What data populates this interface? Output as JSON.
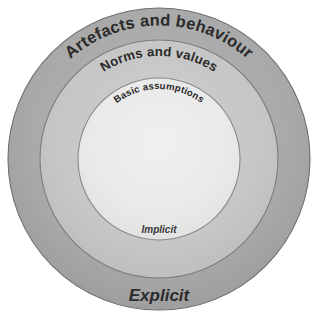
{
  "diagram": {
    "type": "concentric-circles",
    "background_color": "#ffffff",
    "center": {
      "x": 159,
      "y": 159
    },
    "rings": [
      {
        "id": "outer",
        "name": "artefacts-and-behaviour",
        "label": "Artefacts and behaviour",
        "radius": 151,
        "fill": "#a9a9a9",
        "stroke": "#6f6f6f",
        "label_style": "curved-top"
      },
      {
        "id": "middle",
        "name": "norms-and-values",
        "label": "Norms and values",
        "radius": 119,
        "fill": "#c6c6c6",
        "stroke": "#7c7c7c",
        "label_style": "curved-top"
      },
      {
        "id": "inner",
        "name": "basic-assumptions",
        "label": "Basic assumptions",
        "radius": 81,
        "fill": "#e9e9e9",
        "stroke": "#8a8a8a",
        "label_style": "curved-top"
      }
    ],
    "axis_labels": {
      "implicit": "Implicit",
      "explicit": "Explicit"
    },
    "text_color": "#2b2b2b"
  }
}
